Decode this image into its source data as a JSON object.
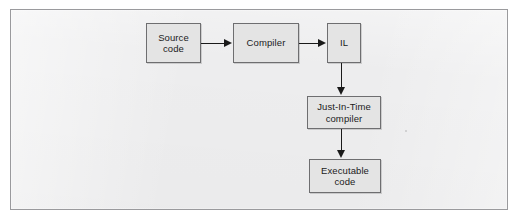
{
  "diagram": {
    "type": "flowchart",
    "panel": {
      "background_color": "#ededee",
      "border_color": "#9a9a9d"
    },
    "node_style": {
      "fill_color": "#e4e4e4",
      "border_color": "#6e6e70",
      "text_color": "#1b1b1b"
    },
    "connector_color": "#1a1a1a",
    "nodes": [
      {
        "id": "source",
        "label": "Source\ncode"
      },
      {
        "id": "compiler",
        "label": "Compiler"
      },
      {
        "id": "il",
        "label": "IL"
      },
      {
        "id": "jit",
        "label": "Just-In-Time\ncompiler"
      },
      {
        "id": "executable",
        "label": "Executable\ncode"
      }
    ],
    "edges": [
      {
        "from": "source",
        "to": "compiler",
        "direction": "right"
      },
      {
        "from": "compiler",
        "to": "il",
        "direction": "right"
      },
      {
        "from": "il",
        "to": "jit",
        "direction": "down"
      },
      {
        "from": "jit",
        "to": "executable",
        "direction": "down"
      }
    ]
  }
}
